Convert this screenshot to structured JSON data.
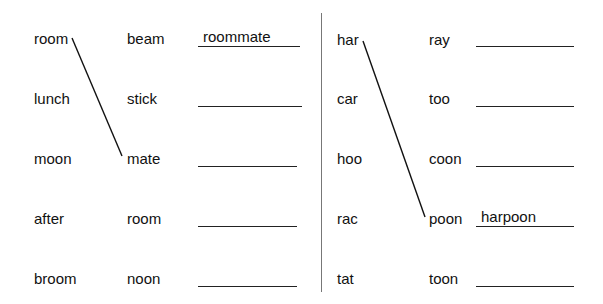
{
  "left": {
    "col1": [
      "room",
      "lunch",
      "moon",
      "after",
      "broom"
    ],
    "col2": [
      "beam",
      "stick",
      "mate",
      "room",
      "noon"
    ],
    "answers": [
      "roommate",
      "",
      "",
      "",
      ""
    ]
  },
  "right": {
    "col1": [
      "har",
      "car",
      "hoo",
      "rac",
      "tat"
    ],
    "col2": [
      "ray",
      "too",
      "coon",
      "poon",
      "toon"
    ],
    "answers": [
      "",
      "",
      "",
      "harpoon",
      ""
    ]
  },
  "connectors": [
    {
      "from": "room",
      "to": "mate"
    },
    {
      "from": "har",
      "to": "poon"
    }
  ]
}
